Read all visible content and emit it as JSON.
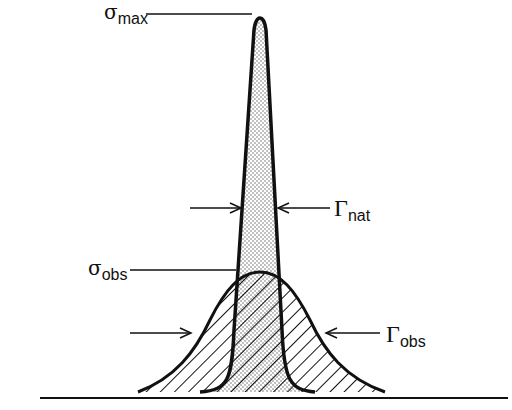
{
  "diagram": {
    "labels": {
      "sigma_max": {
        "symbol": "σ",
        "subscript": "max"
      },
      "sigma_obs": {
        "symbol": "σ",
        "subscript": "obs"
      },
      "gamma_nat": {
        "symbol": "Γ",
        "subscript": "nat"
      },
      "gamma_obs": {
        "symbol": "Γ",
        "subscript": "obs"
      }
    },
    "curves": [
      {
        "name": "natural-profile",
        "shape": "narrow tall peak",
        "fill": "stippled"
      },
      {
        "name": "observed-profile",
        "shape": "broad gaussian",
        "fill": "hatched"
      }
    ],
    "colors": {
      "line": "#111111",
      "background": "#ffffff"
    }
  }
}
